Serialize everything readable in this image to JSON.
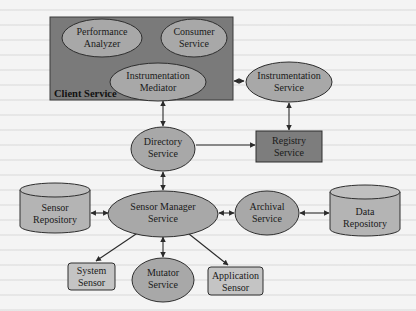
{
  "diagram": {
    "colors": {
      "background": "#f4f4f4",
      "container_fill": "#7a7a7a",
      "ellipse_fill": "#a8a8a8",
      "light_box_fill": "#c4c4c4",
      "dark_box_fill": "#7d7d7d",
      "stroke": "#2e2e2e",
      "edge": "#2a2a2a"
    },
    "container": {
      "label": "Client Service",
      "children": [
        {
          "id": "performance-analyzer",
          "shape": "ellipse",
          "lines": [
            "Performance",
            "Analyzer"
          ]
        },
        {
          "id": "consumer-service",
          "shape": "ellipse",
          "lines": [
            "Consumer",
            "Service"
          ]
        },
        {
          "id": "instrumentation-mediator",
          "shape": "ellipse",
          "lines": [
            "Instrumentation",
            "Mediator"
          ]
        }
      ]
    },
    "nodes": {
      "instrumentation_service": {
        "shape": "ellipse",
        "lines": [
          "Instrumentation",
          "Service"
        ]
      },
      "directory_service": {
        "shape": "ellipse",
        "lines": [
          "Directory",
          "Service"
        ]
      },
      "registry_service": {
        "shape": "rectangle-dark",
        "lines": [
          "Registry",
          "Service"
        ]
      },
      "sensor_repository": {
        "shape": "cylinder",
        "lines": [
          "Sensor",
          "Repository"
        ]
      },
      "sensor_manager_service": {
        "shape": "ellipse",
        "lines": [
          "Sensor Manager",
          "Service"
        ]
      },
      "archival_service": {
        "shape": "ellipse",
        "lines": [
          "Archival",
          "Service"
        ]
      },
      "data_repository": {
        "shape": "cylinder",
        "lines": [
          "Data",
          "Repository"
        ]
      },
      "system_sensor": {
        "shape": "rounded-rectangle",
        "lines": [
          "System",
          "Sensor"
        ]
      },
      "mutator_service": {
        "shape": "ellipse",
        "lines": [
          "Mutator",
          "Service"
        ]
      },
      "application_sensor": {
        "shape": "rounded-rectangle",
        "lines": [
          "Application",
          "Sensor"
        ]
      }
    },
    "edges": [
      {
        "from": "Client Service",
        "to": "Instrumentation Service",
        "type": "bidirectional"
      },
      {
        "from": "Client Service",
        "to": "Directory Service",
        "type": "bidirectional"
      },
      {
        "from": "Instrumentation Service",
        "to": "Registry Service",
        "type": "bidirectional"
      },
      {
        "from": "Directory Service",
        "to": "Registry Service",
        "type": "directed"
      },
      {
        "from": "Directory Service",
        "to": "Sensor Manager Service",
        "type": "bidirectional"
      },
      {
        "from": "Sensor Repository",
        "to": "Sensor Manager Service",
        "type": "bidirectional"
      },
      {
        "from": "Sensor Manager Service",
        "to": "Archival Service",
        "type": "bidirectional"
      },
      {
        "from": "Archival Service",
        "to": "Data Repository",
        "type": "bidirectional"
      },
      {
        "from": "Sensor Manager Service",
        "to": "System Sensor",
        "type": "bidirectional"
      },
      {
        "from": "Sensor Manager Service",
        "to": "Mutator Service",
        "type": "bidirectional"
      },
      {
        "from": "Sensor Manager Service",
        "to": "Application Sensor",
        "type": "bidirectional"
      }
    ]
  }
}
